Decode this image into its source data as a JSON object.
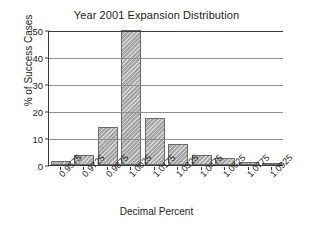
{
  "chart_data": {
    "type": "bar",
    "title": "Year 2001 Expansion Distribution",
    "xlabel": "Decimal Percent",
    "ylabel": "% of Success Cases",
    "categories": [
      "0.9575",
      "0.9725",
      "0.9875",
      "1.0025",
      "1.0175",
      "1.0325",
      "1.0475",
      "1.0625",
      "1.0775",
      "1.0925"
    ],
    "values": [
      1.5,
      3.7,
      14,
      50,
      17.4,
      7.8,
      3.7,
      2.5,
      1.0,
      0.4
    ],
    "ylim": [
      0,
      50
    ],
    "yticks": [
      "0",
      "10",
      "20",
      "30",
      "40",
      "50"
    ],
    "ytick_values": [
      0,
      10,
      20,
      30,
      40,
      50
    ],
    "grid": "horizontal",
    "legend": "none",
    "bar_color": "#a6a6a6",
    "bar_edge_color": "#6a6a6a",
    "axis_color": "#3a3a3a",
    "grid_color": "#8f8f8f",
    "background": "#ffffff"
  }
}
